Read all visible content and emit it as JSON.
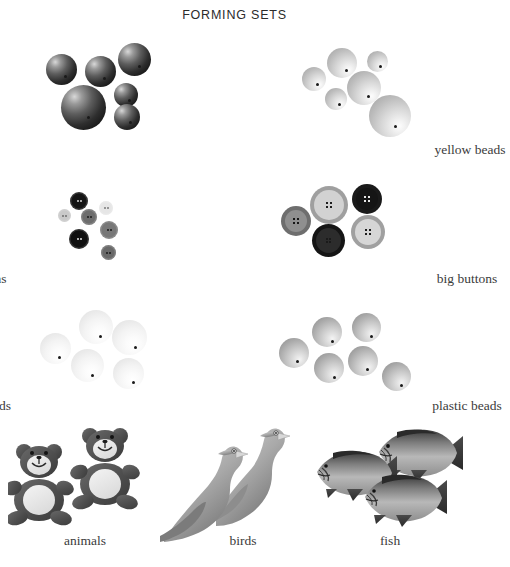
{
  "page": {
    "title": "FORMING SETS",
    "background": "#ffffff",
    "width": 469,
    "height": 567
  },
  "groups": [
    {
      "id": "red-beads",
      "caption": "red beads",
      "kind": "beads",
      "count": 6,
      "color_name": "red",
      "items": [
        {
          "x": 46,
          "y": 54,
          "d": 31,
          "hole_x": 18,
          "hole_y": 21
        },
        {
          "x": 85,
          "y": 56,
          "d": 31,
          "hole_x": 18,
          "hole_y": 21
        },
        {
          "x": 118,
          "y": 43,
          "d": 33,
          "hole_x": 20,
          "hole_y": 22
        },
        {
          "x": 114,
          "y": 83,
          "d": 24,
          "hole_x": 14,
          "hole_y": 16
        },
        {
          "x": 61,
          "y": 85,
          "d": 45,
          "hole_x": 26,
          "hole_y": 31
        },
        {
          "x": 114,
          "y": 104,
          "d": 26,
          "hole_x": 15,
          "hole_y": 17
        }
      ]
    },
    {
      "id": "yellow-beads",
      "caption": "yellow beads",
      "kind": "beads",
      "count": 6,
      "color_name": "yellow",
      "items": [
        {
          "x": 327,
          "y": 48,
          "d": 30,
          "hole_x": 18,
          "hole_y": 21
        },
        {
          "x": 367,
          "y": 51,
          "d": 21,
          "hole_x": 12,
          "hole_y": 14
        },
        {
          "x": 302,
          "y": 67,
          "d": 24,
          "hole_x": 14,
          "hole_y": 16
        },
        {
          "x": 325,
          "y": 88,
          "d": 22,
          "hole_x": 13,
          "hole_y": 15
        },
        {
          "x": 347,
          "y": 71,
          "d": 34,
          "hole_x": 20,
          "hole_y": 24
        },
        {
          "x": 369,
          "y": 95,
          "d": 42,
          "hole_x": 25,
          "hole_y": 30
        }
      ]
    },
    {
      "id": "little-buttons",
      "caption": "little buttons",
      "kind": "little-buttons",
      "count": 7,
      "items": [
        {
          "x": 70,
          "y": 192,
          "d": 18,
          "face": "#141414",
          "hole": "#d6d6d6"
        },
        {
          "x": 99,
          "y": 201,
          "d": 14,
          "face": "#e6e6e6",
          "hole": "#7a7a7a"
        },
        {
          "x": 58,
          "y": 209,
          "d": 13,
          "face": "#c9c9c9",
          "hole": "#6e6e6e"
        },
        {
          "x": 81,
          "y": 209,
          "d": 16,
          "face": "#6d6d6d",
          "hole": "#1c1c1c"
        },
        {
          "x": 100,
          "y": 221,
          "d": 18,
          "face": "#777777",
          "hole": "#1a1a1a"
        },
        {
          "x": 69,
          "y": 229,
          "d": 20,
          "face": "#101010",
          "hole": "#e4e4e4"
        },
        {
          "x": 101,
          "y": 245,
          "d": 15,
          "face": "#696969",
          "hole": "#1a1a1a"
        }
      ]
    },
    {
      "id": "big-buttons",
      "caption": "big buttons",
      "kind": "big-buttons",
      "count": 5,
      "items": [
        {
          "x": 310,
          "y": 186,
          "d": 38,
          "ring": "#9f9f9f",
          "face": "#d2d2d2",
          "hole": "#1d1d1d"
        },
        {
          "x": 352,
          "y": 184,
          "d": 30,
          "ring": "#1a1a1a",
          "face": "#151515",
          "hole": "#e8e8e8"
        },
        {
          "x": 281,
          "y": 206,
          "d": 30,
          "ring": "#6e6e6e",
          "face": "#8f8f8f",
          "hole": "#171717"
        },
        {
          "x": 312,
          "y": 224,
          "d": 33,
          "ring": "#151515",
          "face": "#2c2c2c",
          "hole": "#1a1a1a"
        },
        {
          "x": 351,
          "y": 215,
          "d": 34,
          "ring": "#a0a0a0",
          "face": "#d6d6d6",
          "hole": "#1d1d1d"
        }
      ]
    },
    {
      "id": "wooden-beads",
      "caption": "wooden beads",
      "kind": "beads",
      "count": 5,
      "color_name": "wooden",
      "items": [
        {
          "x": 40,
          "y": 333,
          "d": 31,
          "hole_x": 18,
          "hole_y": 23
        },
        {
          "x": 79,
          "y": 310,
          "d": 34,
          "hole_x": 20,
          "hole_y": 25
        },
        {
          "x": 112,
          "y": 320,
          "d": 35,
          "hole_x": 22,
          "hole_y": 26
        },
        {
          "x": 71,
          "y": 349,
          "d": 33,
          "hole_x": 20,
          "hole_y": 25
        },
        {
          "x": 113,
          "y": 358,
          "d": 31,
          "hole_x": 19,
          "hole_y": 23
        }
      ]
    },
    {
      "id": "plastic-beads",
      "caption": "plastic beads",
      "kind": "beads",
      "count": 6,
      "color_name": "plastic",
      "items": [
        {
          "x": 279,
          "y": 338,
          "d": 30,
          "hole_x": 17,
          "hole_y": 22
        },
        {
          "x": 312,
          "y": 317,
          "d": 30,
          "hole_x": 19,
          "hole_y": 23
        },
        {
          "x": 352,
          "y": 313,
          "d": 29,
          "hole_x": 18,
          "hole_y": 22
        },
        {
          "x": 314,
          "y": 353,
          "d": 30,
          "hole_x": 19,
          "hole_y": 23
        },
        {
          "x": 348,
          "y": 346,
          "d": 30,
          "hole_x": 18,
          "hole_y": 22
        },
        {
          "x": 382,
          "y": 362,
          "d": 29,
          "hole_x": 18,
          "hole_y": 22
        }
      ]
    },
    {
      "id": "animals",
      "caption": "animals",
      "kind": "bears",
      "count": 2
    },
    {
      "id": "birds",
      "caption": "birds",
      "kind": "birds",
      "count": 2
    },
    {
      "id": "fish",
      "caption": "fish",
      "kind": "fish",
      "count": 3
    }
  ],
  "captions": {
    "red_beads": "red beads",
    "yellow_beads": "yellow beads",
    "little_buttons": "little buttons",
    "big_buttons": "big buttons",
    "wooden_beads": "wooden beads",
    "plastic_beads": "plastic beads",
    "animals": "animals",
    "birds": "birds",
    "fish": "fish"
  }
}
